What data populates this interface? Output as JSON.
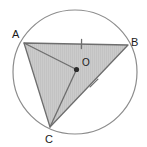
{
  "figure": {
    "background_color": "#ffffff",
    "canvas": {
      "width": 147,
      "height": 147
    }
  },
  "circle": {
    "name": "circumscribed-circle",
    "center": {
      "x": 75,
      "y": 72
    },
    "radius": 62,
    "stroke_color": "#8c8c8c",
    "stroke_width": 1.2,
    "fill": "none"
  },
  "center_point": {
    "label": "O",
    "dot": {
      "x": 76.5,
      "y": 69.5,
      "r": 2.6
    },
    "dot_color": "#2b2b2b",
    "label_position": {
      "x": 82,
      "y": 66
    }
  },
  "triangle": {
    "name": "triangle-ABC",
    "fill_color": "#c9c9c9",
    "fill_opacity": 1,
    "stroke_color": "#6e6e6e",
    "stroke_width": 1.3,
    "vertices": [
      {
        "label": "A",
        "x": 24,
        "y": 43,
        "label_position": {
          "x": 12,
          "y": 38
        }
      },
      {
        "label": "B",
        "x": 128,
        "y": 45,
        "label_position": {
          "x": 131,
          "y": 46
        }
      },
      {
        "label": "C",
        "x": 50,
        "y": 127,
        "label_position": {
          "x": 45,
          "y": 143
        }
      }
    ]
  },
  "radii": [
    {
      "name": "radius-OA",
      "from": "O",
      "to": "A",
      "x1": 76.5,
      "y1": 69.5,
      "x2": 24,
      "y2": 43
    },
    {
      "name": "radius-OC",
      "from": "O",
      "to": "C",
      "x1": 76.5,
      "y1": 69.5,
      "x2": 50,
      "y2": 127
    }
  ],
  "tick_marks": [
    {
      "name": "tick-on-AB",
      "on_segment": "AB",
      "style": "single",
      "x": 81.5,
      "y": 44,
      "length": 9,
      "angle_deg": 1,
      "color": "#6e6e6e"
    },
    {
      "name": "tick-on-CB",
      "on_segment": "CB",
      "style": "single-cross",
      "x": 94,
      "y": 83,
      "length": 11,
      "angle_deg": 45,
      "color": "#6e6e6e"
    }
  ],
  "labels": {
    "vertex_a": "A",
    "vertex_b": "B",
    "vertex_c": "C",
    "center_o": "O"
  }
}
